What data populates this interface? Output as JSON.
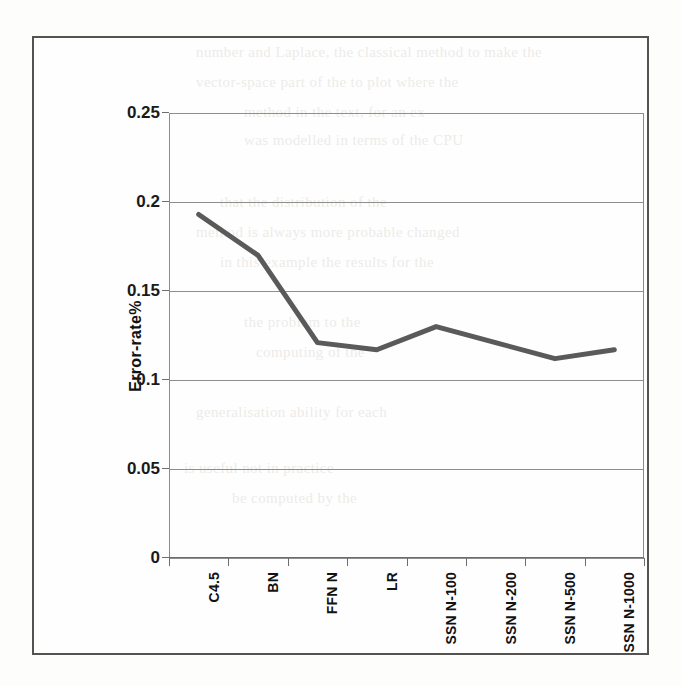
{
  "figure": {
    "background_color": "#fdfdfc",
    "frame_color": "#55534f"
  },
  "chart_data": {
    "type": "line",
    "title": "",
    "xlabel": "",
    "ylabel": "Error-rate%",
    "categories": [
      "C4.5",
      "BN",
      "FFN N",
      "LR",
      "SSN N-100",
      "SSN N-200",
      "SSN N-500",
      "SSN N-1000"
    ],
    "series": [
      {
        "name": "Error-rate%",
        "values": [
          0.193,
          0.17,
          0.121,
          0.117,
          0.13,
          0.121,
          0.112,
          0.117
        ],
        "color": "#5a5a5a",
        "line_width": 5,
        "markers": "none"
      }
    ],
    "ylim": [
      0,
      0.25
    ],
    "yticks": [
      0,
      0.05,
      0.1,
      0.15,
      0.2,
      0.25
    ],
    "ytick_labels": [
      "0",
      "0.05",
      "0.1",
      "0.15",
      "0.2",
      "0.25"
    ],
    "grid": "horizontal",
    "legend": "none"
  },
  "bleed_text": {
    "lines": [
      {
        "text": "number   and  Laplace, the classical method   to make the",
        "x": 196,
        "y": 44
      },
      {
        "text": "vector-space   part    of    the     to    plot   where  the",
        "x": 196,
        "y": 74
      },
      {
        "text": "method  in  the  text,  for  an  ex-",
        "x": 244,
        "y": 104
      },
      {
        "text": "was   modelled  in  terms  of  the  CPU",
        "x": 244,
        "y": 132
      },
      {
        "text": "that   the   distribution   of   the",
        "x": 220,
        "y": 194
      },
      {
        "text": "method  is  always  more  probable  changed",
        "x": 196,
        "y": 224
      },
      {
        "text": "in    this   example  the   results   for   the",
        "x": 220,
        "y": 254
      },
      {
        "text": "the      problem  to   the",
        "x": 244,
        "y": 314
      },
      {
        "text": "computing      of   the",
        "x": 256,
        "y": 344
      },
      {
        "text": "generalisation  ability  for  each",
        "x": 196,
        "y": 404
      },
      {
        "text": "is    useful    not    in    practice",
        "x": 184,
        "y": 460
      },
      {
        "text": "be   computed   by  the",
        "x": 232,
        "y": 490
      }
    ]
  }
}
